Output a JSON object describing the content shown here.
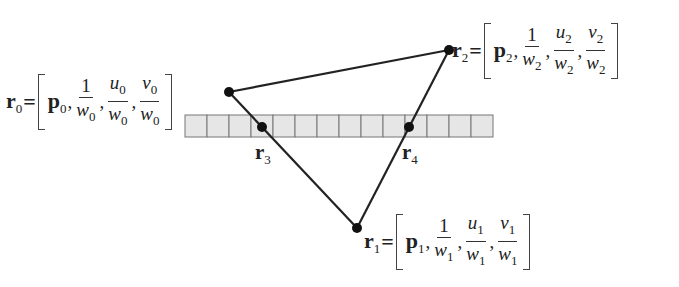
{
  "diagram": {
    "colors": {
      "line": "#222222",
      "point": "#111111",
      "cell_fill": "#e6e6e6",
      "cell_border": "#777777"
    },
    "strip": {
      "x": 185,
      "y": 115,
      "cell_width": 22,
      "cell_height": 22,
      "cell_count": 14
    },
    "vertices": [
      {
        "id": "r0",
        "label": "r",
        "sub": "0",
        "x": 229,
        "y": 92,
        "p": "p",
        "w": "w",
        "u": "u",
        "v": "v",
        "one": "1"
      },
      {
        "id": "r1",
        "label": "r",
        "sub": "1",
        "x": 357,
        "y": 228,
        "p": "p",
        "w": "w",
        "u": "u",
        "v": "v",
        "one": "1"
      },
      {
        "id": "r2",
        "label": "r",
        "sub": "2",
        "x": 449,
        "y": 50,
        "p": "p",
        "w": "w",
        "u": "u",
        "v": "v",
        "one": "1"
      }
    ],
    "intersections": [
      {
        "id": "r3",
        "label": "r",
        "sub": "3",
        "x": 262,
        "y": 127
      },
      {
        "id": "r4",
        "label": "r",
        "sub": "4",
        "x": 409,
        "y": 127
      }
    ],
    "equals": "=",
    "comma": ","
  }
}
